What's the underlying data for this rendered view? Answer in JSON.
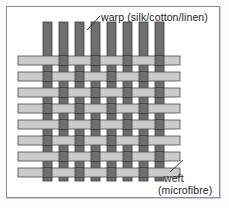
{
  "figure": {
    "title_alt": "Plain weave diagram",
    "frame": {
      "border_color": "#8c8c96",
      "background": "#ffffff"
    },
    "labels": {
      "warp": "warp (silk/cotton/linen)",
      "weft_line1": "weft",
      "weft_line2": "(microfibre)"
    },
    "leader_lines": {
      "warp": {
        "from_x": 87,
        "from_y": 30,
        "to_x": 100,
        "to_y": 16
      },
      "weft": {
        "from_x": 183,
        "from_y": 160,
        "to_x": 170,
        "to_y": 172
      }
    }
  },
  "weave": {
    "type": "plain-weave",
    "warp": {
      "name": "warp",
      "material": "silk/cotton/linen",
      "orientation": "vertical",
      "count": 8,
      "color": "#6e6e6e",
      "stroke": "#3d3d3d",
      "strip_width": 9,
      "x_positions": [
        43,
        59,
        75,
        91,
        107,
        123,
        139,
        155
      ],
      "y_start": 22,
      "y_end": 181
    },
    "weft": {
      "name": "weft",
      "material": "microfibre",
      "orientation": "horizontal",
      "count": 8,
      "color": "#cbcbcb",
      "stroke": "#4a4a4a",
      "strip_height": 9,
      "y_positions": [
        56,
        72,
        88,
        104,
        120,
        136,
        152,
        168
      ],
      "x_start": 18,
      "x_end": 180
    },
    "pattern_note": "over-under alternating; row r and column c: weft is on top when (r + c) is even"
  }
}
